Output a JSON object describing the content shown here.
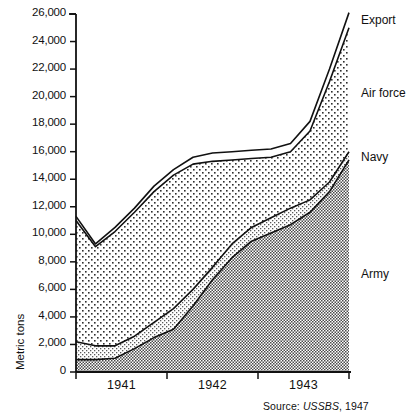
{
  "chart_data": {
    "type": "area",
    "stacked": true,
    "title": "",
    "xlabel": "",
    "ylabel": "Metric tons",
    "ylim": [
      0,
      26000
    ],
    "ytick_labels": [
      "26,000",
      "24,000",
      "22,000",
      "20,000",
      "18,000",
      "16,000",
      "14,000",
      "12,000",
      "10,000",
      "8,000",
      "6,000",
      "4,000",
      "2,000",
      "0"
    ],
    "ytick_values": [
      26000,
      24000,
      22000,
      20000,
      18000,
      16000,
      14000,
      12000,
      10000,
      8000,
      6000,
      4000,
      2000,
      0
    ],
    "xtick_labels": [
      "1941",
      "1942",
      "1943"
    ],
    "x": [
      0,
      1,
      2,
      3,
      4,
      5,
      6,
      7,
      8,
      9,
      10,
      11,
      12,
      13,
      14
    ],
    "x_note": "Quarterly points from mid-1940 through end of 1943",
    "grid": false,
    "legend_position": "right-inline",
    "series": [
      {
        "name": "Army",
        "values": [
          900,
          900,
          1000,
          1700,
          2500,
          3100,
          4800,
          6700,
          8300,
          9500,
          10100,
          10700,
          11600,
          13100,
          15400
        ]
      },
      {
        "name": "Navy",
        "values": [
          1300,
          1000,
          900,
          900,
          1100,
          1500,
          1200,
          900,
          1000,
          1000,
          1100,
          1200,
          900,
          700,
          600
        ]
      },
      {
        "name": "Air force",
        "values": [
          8800,
          7200,
          8300,
          9000,
          9500,
          9700,
          9100,
          7700,
          6100,
          5000,
          4400,
          4100,
          5000,
          7300,
          9000
        ]
      },
      {
        "name": "Export",
        "values": [
          300,
          200,
          300,
          300,
          400,
          400,
          500,
          600,
          600,
          600,
          600,
          600,
          700,
          900,
          1100
        ]
      }
    ],
    "series_cumulative_top": {
      "Army": [
        900,
        900,
        1000,
        1700,
        2500,
        3100,
        4800,
        6700,
        8300,
        9500,
        10100,
        10700,
        11600,
        13100,
        15400
      ],
      "Navy": [
        2200,
        1900,
        1900,
        2600,
        3600,
        4600,
        6000,
        7600,
        9300,
        10500,
        11200,
        11900,
        12500,
        13800,
        16000
      ],
      "Air force": [
        11000,
        9100,
        10200,
        11600,
        13100,
        14300,
        15100,
        15300,
        15400,
        15500,
        15600,
        16000,
        17500,
        21100,
        25000
      ],
      "Export": [
        11300,
        9300,
        10500,
        11900,
        13500,
        14700,
        15600,
        15900,
        16000,
        16100,
        16200,
        16600,
        18200,
        22000,
        26100
      ]
    },
    "annotations": {
      "total_start": 11300,
      "total_min": 9300,
      "total_end": 26100,
      "plateau_level": 15600
    }
  },
  "labels": {
    "export": "Export",
    "air_force": "Air force",
    "navy": "Navy",
    "army": "Army"
  },
  "source": {
    "prefix": "Source: ",
    "org": "USSBS",
    "suffix": ", 1947"
  },
  "ghost_header": ""
}
